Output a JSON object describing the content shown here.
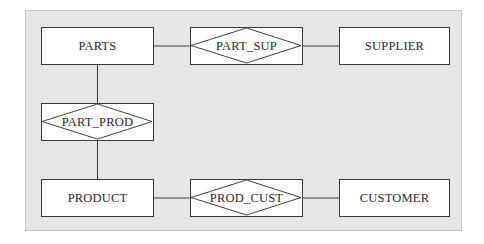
{
  "diagram": {
    "type": "entity-relationship",
    "colors": {
      "panel_background": "#e6e6e6",
      "box_fill": "#ffffff",
      "stroke": "#3a3a3a",
      "text": "#2a2a2a"
    },
    "entities": [
      {
        "id": "parts",
        "label": "PARTS"
      },
      {
        "id": "supplier",
        "label": "SUPPLIER"
      },
      {
        "id": "product",
        "label": "PRODUCT"
      },
      {
        "id": "customer",
        "label": "CUSTOMER"
      }
    ],
    "relationships": [
      {
        "id": "part_sup",
        "label": "PART_SUP",
        "connects": [
          "PARTS",
          "SUPPLIER"
        ]
      },
      {
        "id": "part_prod",
        "label": "PART_PROD",
        "connects": [
          "PARTS",
          "PRODUCT"
        ]
      },
      {
        "id": "prod_cust",
        "label": "PROD_CUST",
        "connects": [
          "PRODUCT",
          "CUSTOMER"
        ]
      }
    ]
  }
}
